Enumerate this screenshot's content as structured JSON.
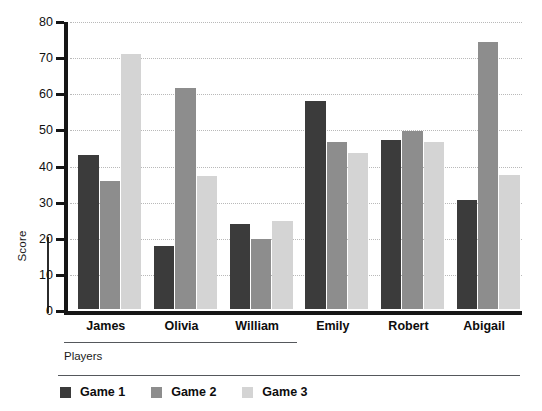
{
  "chart_data": {
    "type": "bar",
    "title": "",
    "subtitle": "",
    "xlabel": "Players",
    "ylabel": "Score",
    "categories": [
      "James",
      "Olivia",
      "William",
      "Emily",
      "Robert",
      "Abigail"
    ],
    "series": [
      {
        "name": "Game 1",
        "color": "#3b3b3b",
        "values": [
          42.5,
          17.5,
          23.5,
          57.5,
          46.8,
          30.2
        ]
      },
      {
        "name": "Game 2",
        "color": "#8d8d8d",
        "values": [
          35.3,
          61.3,
          19.3,
          46.3,
          49.2,
          74.0
        ]
      },
      {
        "name": "Game 3",
        "color": "#d4d4d4",
        "values": [
          70.5,
          36.8,
          24.5,
          43.2,
          46.2,
          37.0
        ]
      }
    ],
    "ylim": [
      0,
      80
    ],
    "yticks": [
      0,
      10,
      20,
      30,
      40,
      50,
      60,
      70,
      80
    ],
    "ytick_labels": [
      "0",
      "10",
      "20",
      "30",
      "40",
      "50",
      "60",
      "70",
      "80"
    ],
    "grid": true,
    "grid_axis": "y",
    "legend_position": "bottom-left",
    "legend_entries": [
      "Game 1",
      "Game 2",
      "Game 3"
    ],
    "axis_color": "#161616",
    "grid_color": "#b9b9b9",
    "background": "#ffffff"
  }
}
